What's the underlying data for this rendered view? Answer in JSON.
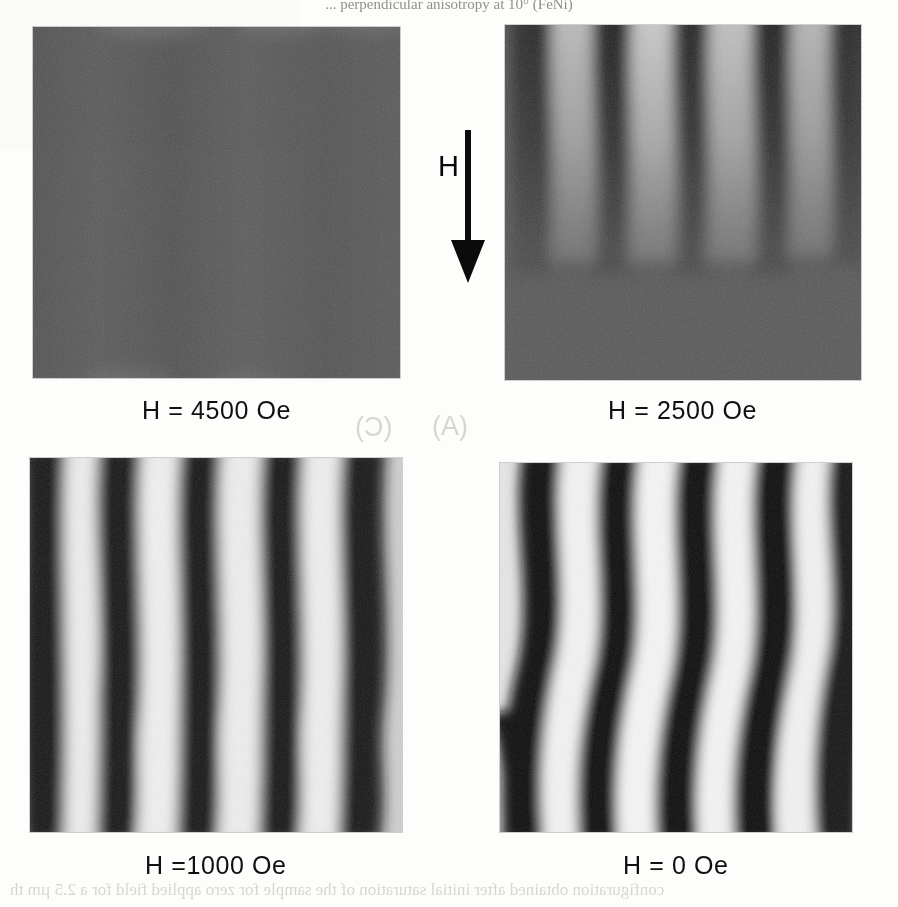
{
  "figure": {
    "kind": "magnetic-domain-micrograph-grid",
    "top_cropped_text": "... perpendicular anisotropy at 10° (FeNi)",
    "field_arrow": {
      "label": "H",
      "direction": "down"
    },
    "panels": [
      {
        "id": "panel-a",
        "position": "top-left",
        "caption": "H = 4500 Oe",
        "field_oe": 4500,
        "state": "saturated",
        "stripe_contrast": 0.04,
        "stripe_period_px": 0,
        "mean_gray": "#5d5d5d",
        "x": 33,
        "y": 27,
        "w": 367,
        "h": 351
      },
      {
        "id": "panel-b",
        "position": "top-right",
        "caption": "H = 2500 Oe",
        "field_oe": 2500,
        "state": "weak-stripes-nucleating",
        "stripe_contrast": 0.42,
        "stripe_period_px": 78,
        "mean_gray": "#5f5f5f",
        "x": 505,
        "y": 25,
        "w": 356,
        "h": 355
      },
      {
        "id": "panel-c",
        "position": "bottom-left",
        "caption": "H =1000 Oe",
        "field_oe": 1000,
        "state": "strong-stripes",
        "stripe_contrast": 0.86,
        "stripe_period_px": 80,
        "mean_gray": "#767676",
        "x": 30,
        "y": 458,
        "w": 372,
        "h": 374
      },
      {
        "id": "panel-d",
        "position": "bottom-right",
        "caption": "H = 0 Oe",
        "field_oe": 0,
        "state": "remanent-wavy-stripes",
        "stripe_contrast": 0.97,
        "stripe_period_px": 82,
        "mean_gray": "#7a7a7a",
        "x": 500,
        "y": 463,
        "w": 352,
        "h": 369
      }
    ],
    "bleed_through": {
      "panel_letters": [
        "(A)",
        "(C)"
      ],
      "caption_line": "configuration obtained after initial saturation of the sample for zero applied field for a 2.5 µm th"
    }
  },
  "chart_data": {
    "type": "heatmap",
    "xlabel": "",
    "ylabel": "",
    "categories": [
      "H = 4500 Oe",
      "H = 2500 Oe",
      "H =1000 Oe",
      "H = 0 Oe"
    ],
    "series": [
      {
        "name": "applied field (Oe)",
        "values": [
          4500,
          2500,
          1000,
          0
        ]
      },
      {
        "name": "stripe domain contrast (0-1)",
        "values": [
          0.04,
          0.42,
          0.86,
          0.97
        ]
      },
      {
        "name": "stripe period (px)",
        "values": [
          0,
          78,
          80,
          82
        ]
      }
    ],
    "legend_position": "none",
    "grid": false,
    "annotations": [
      "H",
      "(A)",
      "(C)"
    ]
  }
}
